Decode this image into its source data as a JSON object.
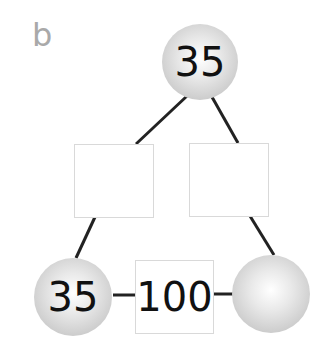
{
  "panel_label": "b",
  "diagram": {
    "top_circle": {
      "value": "35"
    },
    "left_box": {
      "value": ""
    },
    "right_box": {
      "value": ""
    },
    "bottom_left_circle": {
      "value": "35"
    },
    "bottom_middle_box": {
      "value": "100"
    },
    "bottom_right_circle": {
      "value": ""
    }
  },
  "colors": {
    "line": "#222222",
    "label": "#a9a9a9",
    "box_border": "#d9d9d9"
  }
}
